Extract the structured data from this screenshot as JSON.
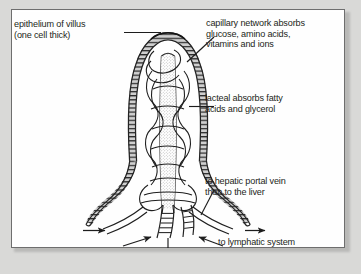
{
  "figure": {
    "caption": ""
  },
  "panel": {
    "background_color": "#fefefe",
    "border_color": "#6e6e6e",
    "page_background_color": "#d9d9d7",
    "ink_color": "#231f20"
  },
  "labels": {
    "epithelium": "epithelium of villus\n(one cell thick)",
    "capillary": "capillary network absorbs\nglucose, amino acids,\nvitamins and ions",
    "lacteal": "lacteal absorbs fatty\nacids and glycerol",
    "hepatic": "to hepatic portal vein\nthen to the liver",
    "lymphatic": "to lymphatic system"
  },
  "structures": {
    "epithelium": "epithelium of villus",
    "capillary_network": "capillary network",
    "lacteal": "lacteal",
    "blood_vessels": "blood vessels to hepatic portal vein",
    "lymph_vessel": "lymph vessel to lymphatic system"
  }
}
